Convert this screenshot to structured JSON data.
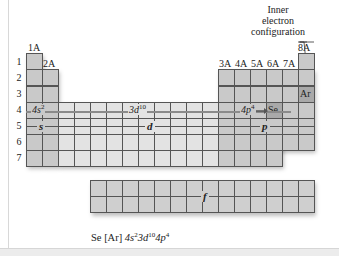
{
  "diagram": {
    "type": "periodic-table-blocks",
    "group_labels": {
      "g1": "1A",
      "g2": "2A",
      "g13": "3A",
      "g14": "4A",
      "g15": "5A",
      "g16": "6A",
      "g17": "7A",
      "g18": "8A"
    },
    "period_labels": [
      "1",
      "2",
      "3",
      "4",
      "5",
      "6",
      "7"
    ],
    "blocks": {
      "s": "s",
      "d": "d",
      "p": "p",
      "f": "f"
    },
    "period4_labels": {
      "s": "4s",
      "s_sup": "2",
      "d": "3d",
      "d_sup": "10",
      "p": "4p",
      "p_sup": "4"
    },
    "highlighted_elements": {
      "noble_gas": "Ar",
      "target": "Se"
    },
    "callout": {
      "line1": "Inner",
      "line2": "electron",
      "line3": "configuration"
    },
    "formula": {
      "element": "Se",
      "core": "[Ar]",
      "t1": "4s",
      "t1_sup": "2",
      "t2": "3d",
      "t2_sup": "10",
      "t3": "4p",
      "t3_sup": "4"
    },
    "colors": {
      "s_block": "#c9c9c9",
      "d_block": "#e3e3e3",
      "p_block": "#c9c9c9",
      "f_block": "#cfcfcf",
      "highlight": "#a9a9a9",
      "grid_line": "#555555"
    }
  }
}
